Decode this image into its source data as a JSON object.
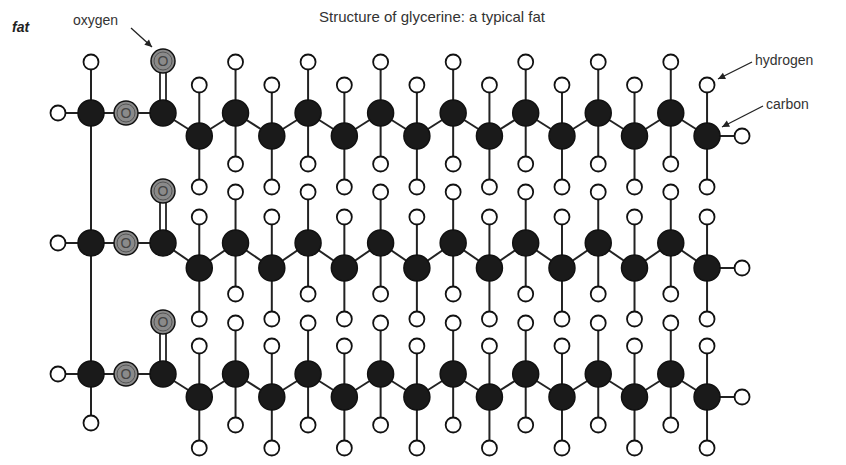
{
  "side_title": "fat",
  "title": "Structure of glycerine: a typical fat",
  "labels": {
    "oxygen": "oxygen",
    "hydrogen": "hydrogen",
    "carbon": "carbon"
  },
  "atom_symbols": {
    "oxygen": "O"
  },
  "colors": {
    "carbon": "#1a1a1a",
    "oxygen": "#8a8a8a",
    "hydrogen": "#ffffff",
    "bond": "#222222"
  },
  "geometry": {
    "chains_y_high": [
      113,
      243,
      374
    ],
    "chains_y_low": [
      136,
      268,
      397
    ],
    "glycerol_x": 91,
    "ester_o_x": 126,
    "carbonyl_x": 163,
    "carbonyl_o_dy": -52,
    "carbon_step_x": 36.27,
    "carbons_per_chain": 16,
    "h_offset": 51,
    "end_h_dx": 35
  },
  "molecule": {
    "glycerol_carbons": 3,
    "fatty_acid_chains": 3,
    "description": "Triglyceride: glycerol backbone esterified with three saturated fatty acid chains"
  }
}
